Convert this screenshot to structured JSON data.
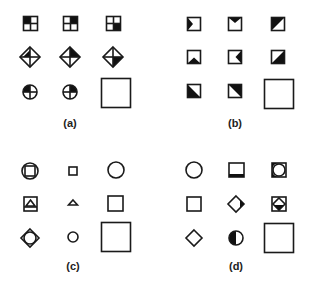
{
  "colors": {
    "stroke": "#1a1a1a",
    "fill": "#111111",
    "background": "#ffffff"
  },
  "panels": [
    {
      "id": "a",
      "label": "(a)",
      "cells": [
        [
          "square-quadrants-topleft-filled",
          "square-quadrants-topright-filled",
          "square-quadrants-bottomright-filled"
        ],
        [
          "diamond-quadrants-topleft-filled",
          "diamond-quadrants-topright-filled",
          "diamond-quadrants-bottomright-filled"
        ],
        [
          "circle-quadrants-topleft-filled",
          "circle-quadrants-topright-filled",
          "answer-blank"
        ]
      ]
    },
    {
      "id": "b",
      "label": "(b)",
      "cells": [
        [
          "square-left-triangle-filled",
          "square-top-triangle-filled",
          "square-diagonal-topleft-filled"
        ],
        [
          "square-bottom-triangle-filled",
          "square-right-triangle-filled",
          "square-diagonal-bottomright-filled"
        ],
        [
          "square-diagonal-bottomleft-filled",
          "square-diagonal-topright-filled",
          "answer-blank"
        ]
      ]
    },
    {
      "id": "c",
      "label": "(c)",
      "cells": [
        [
          "square-in-circle",
          "small-square",
          "circle"
        ],
        [
          "triangle-in-square",
          "small-triangle",
          "square"
        ],
        [
          "circle-in-diamond",
          "small-circle",
          "answer-blank"
        ]
      ]
    },
    {
      "id": "d",
      "label": "(d)",
      "cells": [
        [
          "circle",
          "square-bottom-band-filled",
          "circle-in-square-left-filled"
        ],
        [
          "square",
          "diamond-right-filled",
          "diamond-in-square-bottom-filled"
        ],
        [
          "diamond",
          "circle-left-half-filled",
          "answer-blank"
        ]
      ]
    }
  ]
}
